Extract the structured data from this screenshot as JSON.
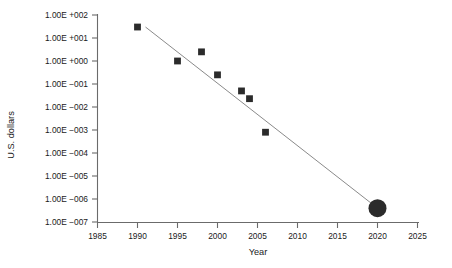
{
  "chart_data": {
    "type": "scatter",
    "title": "",
    "xlabel": "Year",
    "ylabel": "U.S. dollars",
    "xlim": [
      1985,
      2025
    ],
    "ylim": [
      1e-07,
      100.0
    ],
    "yscale": "log",
    "grid": false,
    "legend": null,
    "x_ticks": [
      1985,
      1990,
      1995,
      2000,
      2005,
      2010,
      2015,
      2020,
      2025
    ],
    "x_tick_labels": [
      "1985",
      "1990",
      "1995",
      "2000",
      "2005",
      "2010",
      "2015",
      "2020",
      "2025"
    ],
    "y_ticks": [
      100,
      10,
      1,
      0.1,
      0.01,
      0.001,
      0.0001,
      1e-05,
      1e-06,
      1e-07
    ],
    "y_tick_labels": [
      "1.00E +002",
      "1.00E +001",
      "1.00E +000",
      "1.00E −001",
      "1.00E −002",
      "1.00E −003",
      "1.00E −004",
      "1.00E −005",
      "1.00E −006",
      "1.00E −007"
    ],
    "series": [
      {
        "name": "measured cost",
        "marker": "square",
        "x": [
          1990,
          1995,
          1998,
          2000,
          2003,
          2004,
          2006
        ],
        "y": [
          30,
          1.0,
          2.5,
          0.25,
          0.05,
          0.023,
          0.0008
        ]
      },
      {
        "name": "projected cost",
        "marker": "circle",
        "x": [
          2020
        ],
        "y": [
          4e-07
        ]
      }
    ],
    "trend_line": {
      "name": "trend",
      "x": [
        1991,
        2020
      ],
      "y": [
        30,
        4e-07
      ]
    },
    "colors": {
      "marker": "#2b2b2b",
      "trend": "#8a8a8a",
      "axis": "#6b6b6b",
      "text": "#1a1a1a",
      "background": "#ffffff"
    }
  }
}
